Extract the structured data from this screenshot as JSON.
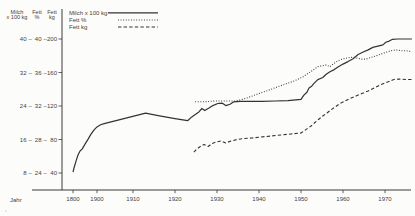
{
  "page": {
    "background": "#fcfcfa",
    "line_color": "#333333",
    "text_color": "#3f3f3f",
    "artifact_mark": "„"
  },
  "axes": {
    "header_columns": [
      [
        "Milch",
        "x 100 kg"
      ],
      [
        "Fett",
        "%"
      ],
      [
        "Fett",
        "kg"
      ]
    ]
  },
  "chart_data": {
    "type": "line",
    "title": "",
    "x_label": "Jahr",
    "x_ticks": [
      1800,
      1900,
      1910,
      1920,
      1930,
      1940,
      1950,
      1960,
      1970
    ],
    "x_axis_note": "broken time scale: 1800-1900 compressed, decades linear after 1900",
    "grid": false,
    "legend_position": "top-left",
    "y_axes": [
      {
        "id": "milch",
        "name": "Milch x 100 kg",
        "ticks": [
          8,
          16,
          24,
          32,
          40
        ]
      },
      {
        "id": "fett_pct",
        "name": "Fett %",
        "ticks": [
          24,
          28,
          32,
          36,
          40
        ]
      },
      {
        "id": "fett_kg",
        "name": "Fett kg",
        "ticks": [
          40,
          80,
          120,
          160,
          200
        ]
      }
    ],
    "y_tick_rows": [
      [
        "40",
        "40",
        "200"
      ],
      [
        "32",
        "36",
        "160"
      ],
      [
        "24",
        "32",
        "120"
      ],
      [
        "16",
        "28",
        "80"
      ],
      [
        "8",
        "24",
        "40"
      ]
    ],
    "series": [
      {
        "name": "Milch x 100 kg",
        "style": "solid",
        "axis": "milch",
        "points": [
          [
            1800,
            8.2
          ],
          [
            1804,
            9.2
          ],
          [
            1813,
            10.9
          ],
          [
            1821,
            12.3
          ],
          [
            1830,
            13.3
          ],
          [
            1838,
            13.7
          ],
          [
            1850,
            14.9
          ],
          [
            1863,
            16.1
          ],
          [
            1875,
            17.3
          ],
          [
            1888,
            18.3
          ],
          [
            1900,
            19.0
          ],
          [
            1901,
            19.5
          ],
          [
            1902,
            19.8
          ],
          [
            1913,
            22.3
          ],
          [
            1916,
            21.7
          ],
          [
            1920,
            21.0
          ],
          [
            1923,
            20.5
          ],
          [
            1924,
            21.4
          ],
          [
            1925,
            22.1
          ],
          [
            1925.7,
            22.6
          ],
          [
            1926.4,
            23.4
          ],
          [
            1927.1,
            22.9
          ],
          [
            1928.1,
            23.5
          ],
          [
            1929,
            24.1
          ],
          [
            1930.2,
            24.6
          ],
          [
            1931.2,
            24.7
          ],
          [
            1932.1,
            24.1
          ],
          [
            1933.1,
            24.4
          ],
          [
            1934,
            25.0
          ],
          [
            1935.5,
            25.1
          ],
          [
            1938,
            25.1
          ],
          [
            1940.7,
            25.1
          ],
          [
            1943.8,
            25.2
          ],
          [
            1946.9,
            25.3
          ],
          [
            1950,
            25.6
          ],
          [
            1950.7,
            26.6
          ],
          [
            1951.4,
            27.3
          ],
          [
            1951.9,
            28.3
          ],
          [
            1952.6,
            28.8
          ],
          [
            1953.1,
            29.4
          ],
          [
            1954,
            30.3
          ],
          [
            1955.2,
            30.8
          ],
          [
            1956,
            31.6
          ],
          [
            1956.9,
            32.2
          ],
          [
            1957.9,
            32.7
          ],
          [
            1958.8,
            33.3
          ],
          [
            1960,
            34.0
          ],
          [
            1961.2,
            34.6
          ],
          [
            1962.4,
            35.3
          ],
          [
            1963.6,
            36.3
          ],
          [
            1964.8,
            36.9
          ],
          [
            1966,
            37.4
          ],
          [
            1967.1,
            38.0
          ],
          [
            1968.3,
            38.3
          ],
          [
            1969.5,
            38.6
          ],
          [
            1970.2,
            39.2
          ],
          [
            1971,
            39.5
          ],
          [
            1971.7,
            39.9
          ],
          [
            1973.1,
            40.0
          ],
          [
            1974.8,
            40.0
          ],
          [
            1976.4,
            40.0
          ]
        ]
      },
      {
        "name": "Fett %",
        "style": "dotted",
        "axis": "fett_pct",
        "points": [
          [
            1924.8,
            32.5
          ],
          [
            1927.1,
            32.5
          ],
          [
            1929.5,
            32.6
          ],
          [
            1931.9,
            32.6
          ],
          [
            1934.3,
            32.6
          ],
          [
            1936.2,
            32.8
          ],
          [
            1937.9,
            33.1
          ],
          [
            1939.5,
            33.4
          ],
          [
            1941.2,
            33.7
          ],
          [
            1942.9,
            34.0
          ],
          [
            1944.5,
            34.3
          ],
          [
            1946.2,
            34.6
          ],
          [
            1947.9,
            34.9
          ],
          [
            1949.3,
            35.2
          ],
          [
            1950.5,
            35.5
          ],
          [
            1951.7,
            35.9
          ],
          [
            1952.9,
            36.3
          ],
          [
            1954,
            36.7
          ],
          [
            1955,
            36.8
          ],
          [
            1956,
            36.9
          ],
          [
            1956.9,
            36.7
          ],
          [
            1957.9,
            37.1
          ],
          [
            1958.8,
            37.4
          ],
          [
            1959.8,
            37.6
          ],
          [
            1960.7,
            37.7
          ],
          [
            1961.7,
            37.8
          ],
          [
            1962.6,
            37.8
          ],
          [
            1963.6,
            37.7
          ],
          [
            1964.5,
            37.6
          ],
          [
            1965.5,
            37.6
          ],
          [
            1966.7,
            37.8
          ],
          [
            1967.9,
            38.0
          ],
          [
            1969,
            38.2
          ],
          [
            1970.2,
            38.4
          ],
          [
            1971.4,
            38.6
          ],
          [
            1972.6,
            38.7
          ],
          [
            1973.8,
            38.6
          ],
          [
            1975,
            38.6
          ],
          [
            1976.4,
            38.5
          ]
        ]
      },
      {
        "name": "Fett kg",
        "style": "dashed",
        "axis": "fett_kg",
        "points": [
          [
            1924.5,
            65.0
          ],
          [
            1925.2,
            68.7
          ],
          [
            1926.2,
            72.2
          ],
          [
            1926.9,
            74.0
          ],
          [
            1927.9,
            71.6
          ],
          [
            1928.8,
            75.2
          ],
          [
            1929.8,
            77.0
          ],
          [
            1931,
            78.2
          ],
          [
            1932.1,
            75.8
          ],
          [
            1933.3,
            78.2
          ],
          [
            1934.8,
            80.0
          ],
          [
            1936.4,
            81.2
          ],
          [
            1938.3,
            81.8
          ],
          [
            1940.5,
            83.0
          ],
          [
            1942.9,
            84.2
          ],
          [
            1945.2,
            85.4
          ],
          [
            1947.6,
            86.6
          ],
          [
            1950,
            87.8
          ],
          [
            1950.7,
            90.1
          ],
          [
            1951.7,
            93.7
          ],
          [
            1952.4,
            96.1
          ],
          [
            1953.3,
            100.3
          ],
          [
            1954.3,
            104.5
          ],
          [
            1955.2,
            108.1
          ],
          [
            1956.2,
            111.6
          ],
          [
            1957.1,
            115.2
          ],
          [
            1958.1,
            118.8
          ],
          [
            1959.3,
            123.0
          ],
          [
            1960.5,
            126.0
          ],
          [
            1961.7,
            129.0
          ],
          [
            1963.1,
            131.9
          ],
          [
            1964.5,
            134.9
          ],
          [
            1966,
            137.9
          ],
          [
            1967.4,
            141.5
          ],
          [
            1968.8,
            145.1
          ],
          [
            1970,
            147.5
          ],
          [
            1971.2,
            149.9
          ],
          [
            1972.1,
            151.6
          ],
          [
            1973.3,
            152.2
          ],
          [
            1974.8,
            151.6
          ],
          [
            1976.4,
            151.6
          ]
        ]
      }
    ]
  }
}
